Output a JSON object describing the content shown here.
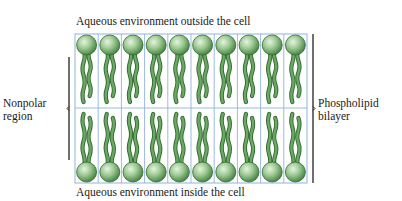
{
  "labels": {
    "top": "Aqueous environment outside the cell",
    "bottom": "Aqueous environment inside the cell",
    "left_line1": "Nonpolar",
    "left_line2": "region",
    "right_line1": "Phospholipid",
    "right_line2": "bilayer"
  },
  "grid": {
    "columns": 10,
    "rows": 2,
    "left": 75,
    "right": 307,
    "top": 34,
    "bottom": 183,
    "midline": 108
  },
  "brackets": {
    "nonpolar_region": {
      "x": 69,
      "y1": 57,
      "y2": 160
    },
    "phospholipid_bilayer": {
      "x": 313,
      "y1": 34,
      "y2": 183
    }
  },
  "colors": {
    "grid_line": "#8fb3dc",
    "head_light": "#d7ebcf",
    "head_mid": "#8fc086",
    "head_dark": "#3f7d3c",
    "tail_fill": "#6aa864",
    "tail_edge": "#2f6a2e",
    "bracket": "#222222",
    "text": "#1a1a1a"
  }
}
